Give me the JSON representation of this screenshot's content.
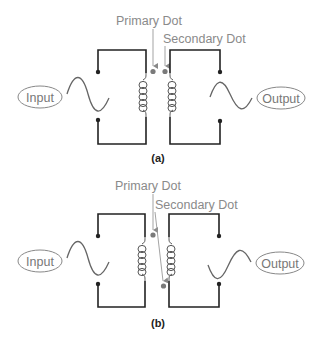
{
  "colors": {
    "wire": "#222222",
    "dot_marker": "#7a7a7a",
    "label_text": "#8a8a8a",
    "io_text": "#777777"
  },
  "diagrams": [
    {
      "id": "a",
      "caption": "(a)",
      "primary_label": "Primary Dot",
      "secondary_label": "Secondary Dot",
      "input_label": "Input",
      "output_label": "Output",
      "secondary_dot_position": "top"
    },
    {
      "id": "b",
      "caption": "(b)",
      "primary_label": "Primary Dot",
      "secondary_label": "Secondary Dot",
      "input_label": "Input",
      "output_label": "Output",
      "secondary_dot_position": "bottom"
    }
  ]
}
